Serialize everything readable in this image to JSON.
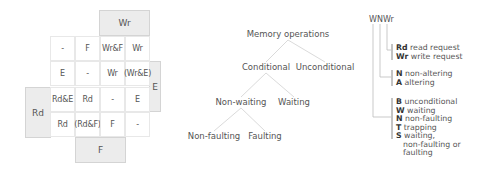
{
  "grid": {
    "top_block": "Wr",
    "right_block": "E",
    "left_block": "Rd",
    "bottom_block": "F",
    "rows": [
      [
        "-",
        "F",
        "Wr&F",
        "Wr"
      ],
      [
        "E",
        "-",
        "Wr",
        "(Wr&E)"
      ],
      [
        "Rd&E",
        "Rd",
        "-",
        "E"
      ],
      [
        "Rd",
        "(Rd&F)",
        "F",
        "-"
      ]
    ]
  },
  "tree": {
    "root": "Memory operations",
    "conditional": "Conditional",
    "unconditional": "Unconditional",
    "non_waiting": "Non-waiting",
    "waiting": "Waiting",
    "non_faulting": "Non-faulting",
    "faulting": "Faulting"
  },
  "legend": {
    "code": "WNWr",
    "groups": [
      {
        "items": [
          {
            "code": "Rd",
            "label": "read request"
          },
          {
            "code": "Wr",
            "label": "write request"
          }
        ]
      },
      {
        "items": [
          {
            "code": "N",
            "label": "non-altering"
          },
          {
            "code": "A",
            "label": "altering"
          }
        ]
      },
      {
        "items": [
          {
            "code": "B",
            "label": "unconditional"
          },
          {
            "code": "W",
            "label": "waiting"
          },
          {
            "code": "N",
            "label": "non-faulting"
          },
          {
            "code": "T",
            "label": "trapping"
          },
          {
            "code": "S",
            "label": "waiting,"
          }
        ],
        "continuation": [
          "non-faulting or",
          "faulting"
        ]
      }
    ]
  }
}
